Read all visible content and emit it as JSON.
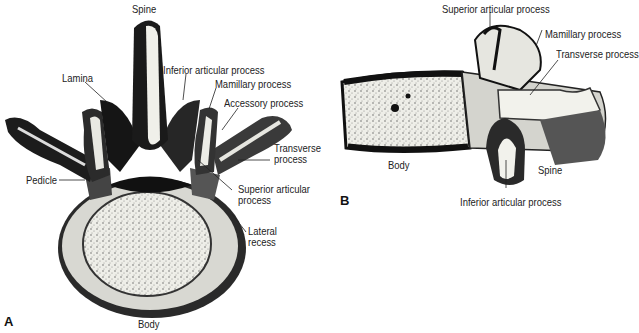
{
  "figure": {
    "panels": [
      {
        "id": "A",
        "view": "superior view of lumbar vertebra",
        "labels": {
          "spine": "Spine",
          "lamina": "Lamina",
          "inferior_articular": "Inferior articular process",
          "mamillary": "Mamillary process",
          "accessory": "Accessory process",
          "transverse_1": "Transverse",
          "transverse_2": "process",
          "pedicle": "Pedicle",
          "superior_articular_1": "Superior articular",
          "superior_articular_2": "process",
          "lateral_recess_1": "Lateral",
          "lateral_recess_2": "recess",
          "body": "Body"
        }
      },
      {
        "id": "B",
        "view": "lateral view of lumbar vertebra",
        "labels": {
          "superior_articular": "Superior articular process",
          "mamillary": "Mamillary process",
          "transverse": "Transverse process",
          "body": "Body",
          "spine": "Spine",
          "inferior_articular": "Inferior articular process"
        }
      }
    ],
    "colors": {
      "ink": "#111111",
      "bone_light": "#f2f2ee",
      "bone_shade": "#6a6a6a",
      "background": "#ffffff"
    }
  }
}
